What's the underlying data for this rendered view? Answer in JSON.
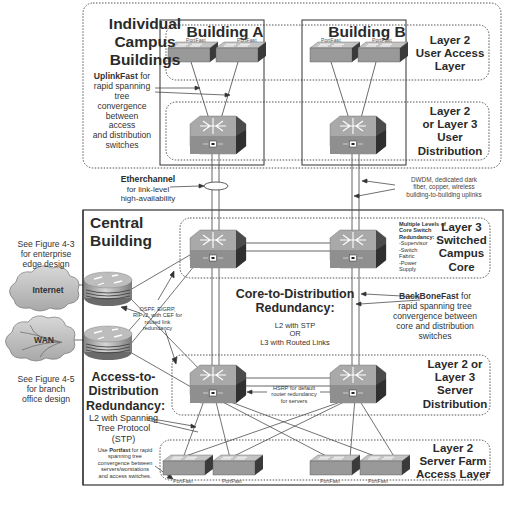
{
  "campus": {
    "title": "Individual Campus Buildings",
    "title_lines": [
      "Individual",
      "Campus",
      "Buildings"
    ],
    "building_a": {
      "label": "Building A",
      "portfast_labels": [
        "PortFast",
        "PortFast"
      ]
    },
    "building_b": {
      "label": "Building B",
      "portfast_labels": [
        "PortFast",
        "PortFast"
      ]
    },
    "uplinkfast_note": {
      "bold": "UplinkFast",
      "rest_lines": [
        " for",
        "rapid spanning",
        "tree convergence",
        "between access",
        "and distribution",
        "switches"
      ]
    },
    "layers": {
      "user_access": [
        "Layer 2",
        "User Access",
        "Layer"
      ],
      "user_distribution": [
        "Layer 2",
        "or Layer 3",
        "User",
        "Distribution"
      ]
    }
  },
  "links": {
    "etherchannel": {
      "bold": "Etherchannel",
      "lines": [
        "for link-level",
        "high-availability"
      ]
    },
    "dwdm": [
      "DWDM, dedicated dark",
      "fiber, copper, wireless",
      "building-to-building uplinks"
    ]
  },
  "central": {
    "title_lines": [
      "Central",
      "Building"
    ],
    "core_redundancy_note": {
      "bold": "Multiple Levels of Core Switch Redundancy:",
      "bold_lines": [
        "Multiple Levels of",
        "Core Switch",
        "Redundancy:"
      ],
      "items": [
        "-Supervisor",
        "-Switch",
        "Fabric",
        "-Power",
        "Supply"
      ]
    },
    "layers": {
      "campus_core": [
        "Layer 3",
        "Switched",
        "Campus",
        "Core"
      ],
      "server_distribution": [
        "Layer 2 or",
        "Layer 3",
        "Server",
        "Distribution"
      ],
      "server_farm_access": [
        "Layer 2",
        "Server Farm",
        "Access Layer"
      ]
    },
    "core_to_distribution": {
      "title_lines": [
        "Core-to-Distribution",
        "Redundancy:"
      ],
      "lines": [
        "L2 with STP",
        "OR",
        "L3 with Routed Links"
      ]
    },
    "backbonefast_note": {
      "bold": "BackBoneFast",
      "lines": [
        " for",
        "rapid spanning tree",
        "convergence between",
        "core and distribution",
        "switches"
      ]
    },
    "routing_note": [
      "OSPF, EIGRP,",
      "RIPv2, with CEF for",
      "routed link",
      "redundancy"
    ],
    "hsrp_note": [
      "HSRP for default",
      "router redundancy",
      "for servers"
    ],
    "access_to_distribution": {
      "title_lines": [
        "Access-to-",
        "Distribution",
        "Redundancy:"
      ],
      "lines": [
        "L2 with Spanning",
        "Tree Protocol",
        "(STP)"
      ]
    },
    "portfast_note": {
      "prefix": "Use ",
      "bold": "Portfast",
      "lines": [
        " for rapid",
        "spanning tree",
        "convergence between",
        "servers/worstations",
        "and access switches."
      ]
    },
    "server_portfast_labels": [
      "PortFast",
      "PortFast",
      "PortFast",
      "PortFast"
    ]
  },
  "edge": {
    "internet_label": "Internet",
    "wan_label": "WAN",
    "figure_4_3": [
      "See Figure 4-3",
      "for enterprise",
      "edge design"
    ],
    "figure_4_5": [
      "See Figure 4-5",
      "for branch",
      "office design"
    ]
  },
  "colors": {
    "device_face": "#9c9c9c",
    "device_top": "#b8b8b8",
    "device_side": "#3a3a3a",
    "line": "#444444",
    "dotted": "#555555"
  }
}
